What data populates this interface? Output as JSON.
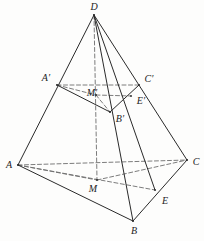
{
  "figure": {
    "type": "geometric-diagram",
    "width": 204,
    "height": 241,
    "background_color": "#fdfdfc",
    "stroke_color": "#2a2a2a",
    "dashed_color": "#6d6d6d",
    "solid_stroke_width": 1.0,
    "dashed_stroke_width": 0.9,
    "dash_pattern": "4,2.5"
  },
  "points": {
    "D": {
      "label": "D",
      "x": 94,
      "y": 15,
      "label_x": 94,
      "label_y": 7
    },
    "A": {
      "label": "A",
      "x": 18,
      "y": 165,
      "label_x": 9,
      "label_y": 165
    },
    "B": {
      "label": "B",
      "x": 133,
      "y": 221,
      "label_x": 134,
      "label_y": 231
    },
    "C": {
      "label": "C",
      "x": 187,
      "y": 160,
      "label_x": 196,
      "label_y": 162
    },
    "M": {
      "label": "M",
      "x": 97,
      "y": 180,
      "label_x": 93,
      "label_y": 189
    },
    "E": {
      "label": "E",
      "x": 155,
      "y": 190,
      "label_x": 165,
      "label_y": 201
    },
    "Ap": {
      "label": "A′",
      "x": 57,
      "y": 85,
      "label_x": 46,
      "label_y": 78
    },
    "Bp": {
      "label": "B′",
      "x": 110,
      "y": 112,
      "label_x": 120,
      "label_y": 119
    },
    "Cp": {
      "label": "C′",
      "x": 139,
      "y": 85,
      "label_x": 149,
      "label_y": 79
    },
    "Mp": {
      "label": "M′",
      "x": 96,
      "y": 95,
      "label_x": 92,
      "label_y": 93
    },
    "Ep": {
      "label": "E′",
      "x": 131,
      "y": 96,
      "label_x": 141,
      "label_y": 101
    }
  },
  "edges": {
    "solid": [
      {
        "name": "edge-D-A",
        "from": "D",
        "to": "A"
      },
      {
        "name": "edge-D-B",
        "from": "D",
        "to": "B"
      },
      {
        "name": "edge-D-C",
        "from": "D",
        "to": "C"
      },
      {
        "name": "edge-D-E",
        "from": "D",
        "to": "E"
      },
      {
        "name": "edge-A-B",
        "from": "A",
        "to": "B"
      },
      {
        "name": "edge-B-C",
        "from": "B",
        "to": "C"
      },
      {
        "name": "edge-Ap-Bp",
        "from": "Ap",
        "to": "Bp"
      },
      {
        "name": "edge-Bp-Cp",
        "from": "Bp",
        "to": "Cp"
      }
    ],
    "dashed": [
      {
        "name": "edge-A-C",
        "from": "A",
        "to": "C"
      },
      {
        "name": "edge-A-M",
        "from": "A",
        "to": "M"
      },
      {
        "name": "edge-M-C",
        "from": "M",
        "to": "C"
      },
      {
        "name": "edge-A-E",
        "from": "A",
        "to": "E"
      },
      {
        "name": "edge-D-M",
        "from": "D",
        "to": "M"
      },
      {
        "name": "edge-Ap-Cp",
        "from": "Ap",
        "to": "Cp"
      },
      {
        "name": "edge-Ap-Mp",
        "from": "Ap",
        "to": "Mp"
      },
      {
        "name": "edge-Mp-Ep",
        "from": "Mp",
        "to": "Ep"
      },
      {
        "name": "edge-Mp-Bp",
        "from": "Mp",
        "to": "Bp"
      }
    ]
  },
  "vertex_order": [
    "D",
    "Ap",
    "Cp",
    "Mp",
    "Ep",
    "Bp",
    "A",
    "C",
    "M",
    "E",
    "B"
  ]
}
